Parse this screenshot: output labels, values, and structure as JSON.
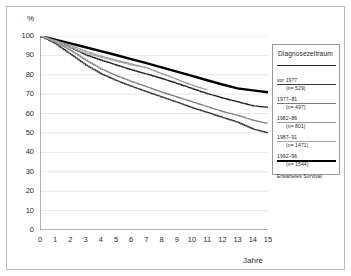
{
  "axes": {
    "y_label": "%",
    "x_label": "Jahre",
    "y_ticks": [
      0,
      10,
      20,
      30,
      40,
      50,
      60,
      70,
      80,
      90,
      100
    ],
    "x_ticks": [
      0,
      1,
      2,
      3,
      4,
      5,
      6,
      7,
      8,
      9,
      10,
      11,
      12,
      13,
      14,
      15
    ]
  },
  "legend": {
    "title": "Diagnosezeitraum",
    "entries": [
      {
        "label": "vor 1977",
        "n": "(n= 529)",
        "color": "#222222",
        "width": 1.2
      },
      {
        "label": "1977–81",
        "n": "(n= 497)",
        "color": "#3a3a3a",
        "width": 1.2
      },
      {
        "label": "1982–86",
        "n": "(n= 801)",
        "color": "#7d7d7d",
        "width": 1.1
      },
      {
        "label": "1987–91",
        "n": "(n= 1471)",
        "color": "#9a9a9a",
        "width": 1.1
      },
      {
        "label": "1992–96",
        "n": "(n= 1544)",
        "color": "#a8a8a8",
        "width": 1.1
      }
    ],
    "expected": {
      "label": "Erwartetes Survival",
      "color": "#000000",
      "width": 2.4
    }
  },
  "chart_data": {
    "type": "line",
    "title": "",
    "xlabel": "Jahre",
    "ylabel": "%",
    "xlim": [
      0,
      15
    ],
    "ylim": [
      0,
      100
    ],
    "grid": true,
    "legend_position": "right",
    "series": [
      {
        "name": "Erwartetes Survival",
        "color": "#000000",
        "width": 2.4,
        "x": [
          0,
          1,
          2,
          3,
          4,
          5,
          6,
          7,
          8,
          9,
          10,
          11,
          12,
          13,
          14,
          15
        ],
        "values": [
          100,
          98.1,
          96.2,
          94.2,
          92.2,
          90.2,
          88.1,
          86.0,
          83.8,
          81.6,
          79.4,
          77.2,
          75.0,
          73.0,
          72.0,
          71.0
        ]
      },
      {
        "name": "vor 1977",
        "color": "#222222",
        "width": 1.2,
        "x": [
          0,
          1,
          2,
          3,
          4,
          5,
          6,
          7,
          8,
          9,
          10,
          11,
          12,
          13,
          14,
          15
        ],
        "values": [
          100,
          97.5,
          94.0,
          90.2,
          87.5,
          85.0,
          82.5,
          80.3,
          78.0,
          75.5,
          72.8,
          70.2,
          68.0,
          66.0,
          64.0,
          63.2
        ]
      },
      {
        "name": "1977–81",
        "color": "#3a3a3a",
        "width": 1.2,
        "x": [
          0,
          1,
          2,
          3,
          4,
          5,
          6,
          7,
          8,
          9,
          10,
          11,
          12,
          13,
          14,
          15
        ],
        "values": [
          100,
          96.0,
          90.5,
          85.0,
          80.5,
          77.0,
          74.0,
          71.2,
          68.5,
          65.8,
          63.0,
          60.5,
          58.0,
          55.5,
          52.0,
          50.0
        ]
      },
      {
        "name": "1982–86",
        "color": "#7d7d7d",
        "width": 1.1,
        "x": [
          0,
          1,
          2,
          3,
          4,
          5,
          6,
          7,
          8,
          9,
          10,
          11,
          12,
          13,
          14,
          15
        ],
        "values": [
          100,
          96.8,
          92.5,
          87.5,
          83.0,
          79.5,
          76.5,
          73.8,
          71.0,
          68.5,
          66.0,
          63.5,
          61.0,
          59.0,
          56.5,
          54.8
        ]
      },
      {
        "name": "1987–91",
        "color": "#9a9a9a",
        "width": 1.1,
        "x": [
          0,
          1,
          2,
          3,
          4,
          5,
          6,
          7,
          8,
          9,
          10,
          11
        ],
        "values": [
          100,
          97.5,
          95.0,
          92.0,
          89.5,
          87.5,
          85.5,
          83.5,
          80.5,
          77.5,
          74.5,
          72.2
        ]
      },
      {
        "name": "1992–96",
        "color": "#a8a8a8",
        "width": 1.1,
        "x": [
          0,
          1,
          2,
          3,
          4,
          5,
          6,
          6.6
        ],
        "values": [
          100,
          97.0,
          94.0,
          91.0,
          89.0,
          87.0,
          85.0,
          84.2
        ]
      }
    ]
  }
}
